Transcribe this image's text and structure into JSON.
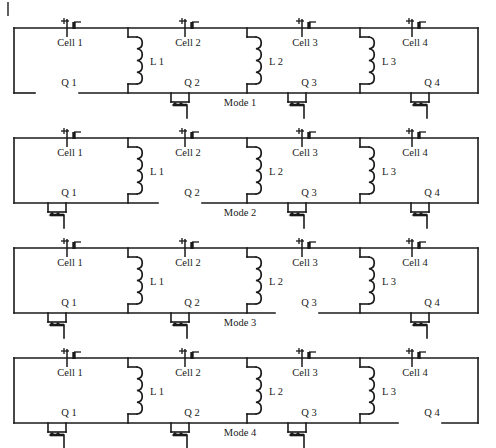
{
  "figure": {
    "corner_mark": "|",
    "geometry": {
      "width": 496,
      "height": 448,
      "panel_height": 110,
      "panel_tops": [
        18,
        128,
        238,
        348
      ],
      "rail_left": 14,
      "rail_right": 478,
      "top_rail_y_offset": 10,
      "bottom_rail_y_offset": 75,
      "cell_x": [
        70,
        188,
        305,
        415
      ],
      "branch_x": [
        128,
        247,
        360
      ],
      "switch_x": [
        57,
        180,
        297,
        420
      ],
      "coil_y_offset": 33,
      "mode_label_x": 240,
      "mode_label_y_offset": 88
    },
    "colors": {
      "ink": "#1a1a1a",
      "paper": "#ffffff"
    }
  },
  "labels": {
    "cells": [
      "Cell 1",
      "Cell 2",
      "Cell 3",
      "Cell 4"
    ],
    "inductors": [
      "L 1",
      "L 2",
      "L 3"
    ],
    "switches": [
      "Q 1",
      "Q 2",
      "Q 3",
      "Q 4"
    ]
  },
  "panels": [
    {
      "mode_label": "Mode 1",
      "cells": [
        "Cell 1",
        "Cell 2",
        "Cell 3",
        "Cell 4"
      ],
      "inductors": [
        "L 1",
        "L 2",
        "L 3"
      ],
      "switches": [
        {
          "name": "Q 1",
          "state": "open"
        },
        {
          "name": "Q 2",
          "state": "closed"
        },
        {
          "name": "Q 3",
          "state": "closed"
        },
        {
          "name": "Q 4",
          "state": "closed"
        }
      ]
    },
    {
      "mode_label": "Mode 2",
      "cells": [
        "Cell 1",
        "Cell 2",
        "Cell 3",
        "Cell 4"
      ],
      "inductors": [
        "L 1",
        "L 2",
        "L 3"
      ],
      "switches": [
        {
          "name": "Q 1",
          "state": "closed"
        },
        {
          "name": "Q 2",
          "state": "open"
        },
        {
          "name": "Q 3",
          "state": "closed"
        },
        {
          "name": "Q 4",
          "state": "closed"
        }
      ]
    },
    {
      "mode_label": "Mode 3",
      "cells": [
        "Cell 1",
        "Cell 2",
        "Cell 3",
        "Cell 4"
      ],
      "inductors": [
        "L 1",
        "L 2",
        "L 3"
      ],
      "switches": [
        {
          "name": "Q 1",
          "state": "closed"
        },
        {
          "name": "Q 2",
          "state": "closed"
        },
        {
          "name": "Q 3",
          "state": "open"
        },
        {
          "name": "Q 4",
          "state": "closed"
        }
      ]
    },
    {
      "mode_label": "Mode 4",
      "cells": [
        "Cell 1",
        "Cell 2",
        "Cell 3",
        "Cell 4"
      ],
      "inductors": [
        "L 1",
        "L 2",
        "L 3"
      ],
      "switches": [
        {
          "name": "Q 1",
          "state": "closed"
        },
        {
          "name": "Q 2",
          "state": "closed"
        },
        {
          "name": "Q 3",
          "state": "closed"
        },
        {
          "name": "Q 4",
          "state": "open"
        }
      ]
    }
  ]
}
